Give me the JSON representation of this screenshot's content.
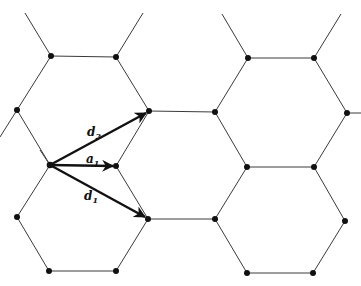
{
  "diagram": {
    "type": "hexagonal-lattice",
    "vectors": [
      {
        "id": "d2",
        "label": "d",
        "subscript": "2"
      },
      {
        "id": "a1",
        "label": "a",
        "subscript": "1"
      },
      {
        "id": "d1",
        "label": "d",
        "subscript": "1"
      }
    ],
    "colors": {
      "lines": "#3a3a3a",
      "vertices": "#111111",
      "vectors": "#111111",
      "background": "#ffffff"
    }
  }
}
